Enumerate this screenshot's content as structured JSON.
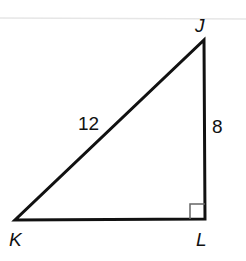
{
  "figure": {
    "type": "right-triangle",
    "vertices": {
      "J": {
        "label": "J",
        "x": 204,
        "y": 40
      },
      "K": {
        "label": "K",
        "x": 15,
        "y": 220
      },
      "L": {
        "label": "L",
        "x": 205,
        "y": 219
      }
    },
    "sides": {
      "hypotenuse_KJ": {
        "label": "12"
      },
      "leg_JL": {
        "label": "8"
      }
    },
    "right_angle_at": "L",
    "colors": {
      "stroke": "#111111",
      "right_angle_marker": "#666666",
      "top_rule": "#e4e4e4"
    }
  }
}
